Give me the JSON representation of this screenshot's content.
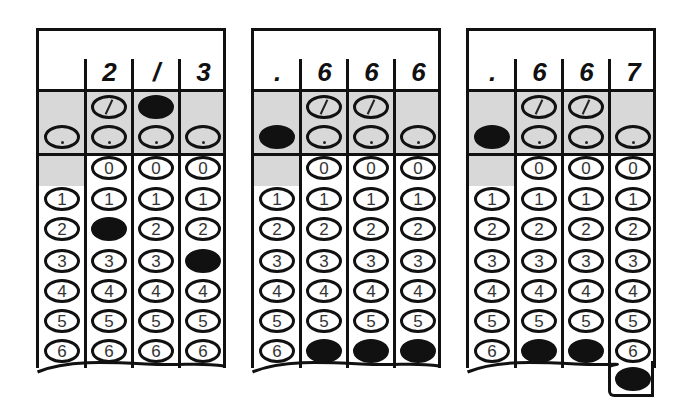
{
  "grids": [
    {
      "name": "grid-2-over-3",
      "header": [
        "",
        "2",
        "/",
        "3"
      ],
      "filled": {
        "slash": [
          2
        ],
        "dot": [],
        "digits": {
          "1": "2",
          "3": "3"
        }
      },
      "answer": "2/3"
    },
    {
      "name": "grid-point-666",
      "header": [
        ".",
        "6",
        "6",
        "6"
      ],
      "filled": {
        "slash": [],
        "dot": [
          0
        ],
        "digits": {
          "1": "6",
          "2": "6",
          "3": "6"
        }
      },
      "answer": ".666"
    },
    {
      "name": "grid-point-667",
      "header": [
        ".",
        "6",
        "6",
        "7"
      ],
      "filled": {
        "slash": [],
        "dot": [
          0
        ],
        "digits": {
          "1": "6",
          "2": "6",
          "3": "7"
        }
      },
      "answer": ".667"
    }
  ],
  "digit_labels": [
    "0",
    "1",
    "2",
    "3",
    "4",
    "5",
    "6",
    "7"
  ],
  "colors": {
    "ink": "#111111",
    "shade": "#d8d8d8",
    "paper": "#ffffff"
  }
}
